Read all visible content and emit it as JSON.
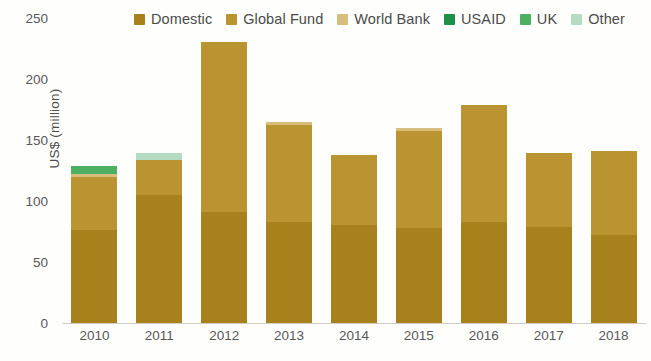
{
  "chart_data": {
    "type": "bar",
    "stacked": true,
    "title": "",
    "xlabel": "",
    "ylabel": "US$ (million)",
    "categories": [
      "2010",
      "2011",
      "2012",
      "2013",
      "2014",
      "2015",
      "2016",
      "2017",
      "2018"
    ],
    "ylim": [
      0,
      250
    ],
    "yticks": [
      0,
      50,
      100,
      150,
      200,
      250
    ],
    "grid": false,
    "legend_position": "top",
    "series": [
      {
        "name": "Domestic",
        "color": "#A6811C",
        "values": [
          76,
          105,
          91,
          83,
          80,
          78,
          83,
          79,
          72
        ]
      },
      {
        "name": "Global Fund",
        "color": "#B99430",
        "values": [
          44,
          29,
          139,
          79,
          58,
          79,
          96,
          60,
          69
        ]
      },
      {
        "name": "World Bank",
        "color": "#D8BE7E",
        "values": [
          2,
          0,
          0,
          3,
          0,
          3,
          0,
          0,
          0
        ]
      },
      {
        "name": "USAID",
        "color": "#1F9049",
        "values": [
          0,
          0,
          0,
          0,
          0,
          0,
          0,
          0,
          0
        ]
      },
      {
        "name": "UK",
        "color": "#4CAF62",
        "values": [
          7,
          0,
          0,
          0,
          0,
          0,
          0,
          0,
          0
        ]
      },
      {
        "name": "Other",
        "color": "#B5DCC3",
        "values": [
          0,
          5,
          0,
          0,
          0,
          0,
          0,
          0,
          0
        ]
      }
    ],
    "totals": [
      129,
      139,
      230,
      165,
      138,
      160,
      179,
      139,
      141
    ]
  },
  "legend": {
    "items": [
      {
        "label": "Domestic",
        "color": "#A6811C"
      },
      {
        "label": "Global Fund",
        "color": "#B99430"
      },
      {
        "label": "World Bank",
        "color": "#D8BE7E"
      },
      {
        "label": "USAID",
        "color": "#1F9049"
      },
      {
        "label": "UK",
        "color": "#4CAF62"
      },
      {
        "label": "Other",
        "color": "#B5DCC3"
      }
    ]
  },
  "axes": {
    "y_title": "US$ (million)",
    "y_ticks": [
      "250",
      "200",
      "150",
      "100",
      "50",
      "0"
    ],
    "x_ticks": [
      "2010",
      "2011",
      "2012",
      "2013",
      "2014",
      "2015",
      "2016",
      "2017",
      "2018"
    ]
  },
  "footnote": {
    "text": ""
  }
}
